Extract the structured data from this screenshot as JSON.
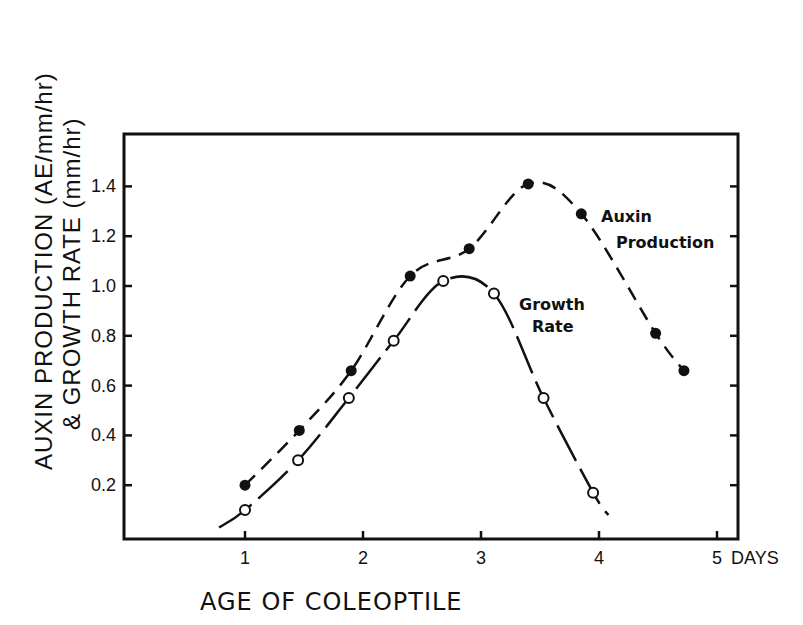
{
  "chart_data": {
    "type": "line",
    "title": "",
    "xlabel": "AGE OF COLEOPTILE",
    "ylabel_line1": "AUXIN PRODUCTION (AE/mm/hr)",
    "ylabel_line2": "& GROWTH RATE (mm/hr)",
    "x_ticks": [
      "1",
      "2",
      "3",
      "4",
      "5"
    ],
    "x_unit_label": "DAYS",
    "y_ticks": [
      "0.2",
      "0.4",
      "0.6",
      "0.8",
      "1.0",
      "1.2",
      "1.4"
    ],
    "xlim": [
      0,
      5.2
    ],
    "ylim": [
      0,
      1.55
    ],
    "grid": false,
    "legend_position": "inline annotations",
    "series": [
      {
        "name": "Auxin Production",
        "label_line1": "Auxin",
        "label_line2": "Production",
        "marker": "filled-circle",
        "line_style": "dashed",
        "x": [
          1.0,
          1.46,
          1.9,
          2.4,
          2.9,
          3.4,
          3.85,
          4.48,
          4.72
        ],
        "values": [
          0.2,
          0.42,
          0.66,
          1.04,
          1.15,
          1.41,
          1.29,
          0.81,
          0.66
        ]
      },
      {
        "name": "Growth Rate",
        "label_line1": "Growth",
        "label_line2": "Rate",
        "marker": "open-circle",
        "line_style": "solid",
        "x": [
          1.0,
          1.45,
          1.88,
          2.26,
          2.68,
          3.11,
          3.53,
          3.95
        ],
        "values": [
          0.1,
          0.3,
          0.55,
          0.78,
          1.02,
          0.97,
          0.55,
          0.17
        ]
      }
    ]
  }
}
